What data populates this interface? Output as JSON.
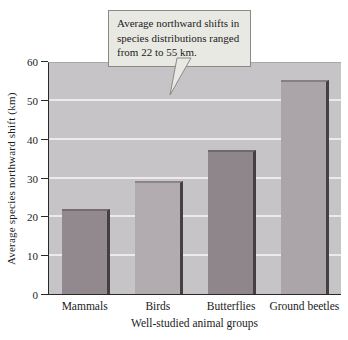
{
  "figure": {
    "callout": {
      "text": "Average northward shifts in\nspecies distributions ranged\nfrom 22 to 55 km.",
      "bg_color": "#e9e9e3",
      "border_color": "#8a8a85"
    }
  },
  "chart_data": {
    "type": "bar",
    "categories": [
      "Mammals",
      "Birds",
      "Butterflies",
      "Ground beetles"
    ],
    "values": [
      22,
      29,
      37,
      55
    ],
    "bar_colors": [
      "#91898e",
      "#b2acb0",
      "#8e868b",
      "#aba5a9"
    ],
    "bar_edge_color": "#453f44",
    "title": "",
    "xlabel": "Well-studied animal groups",
    "ylabel": "Average species northward shift (km)",
    "ylim": [
      0,
      60
    ],
    "yticks": [
      0,
      10,
      20,
      30,
      40,
      50,
      60
    ],
    "grid": true,
    "gridline_color": "#eceaec",
    "plot_bg_color": "#c7c4c7",
    "legend_position": "none",
    "annotation": "Average northward shifts in species distributions ranged from 22 to 55 km."
  }
}
